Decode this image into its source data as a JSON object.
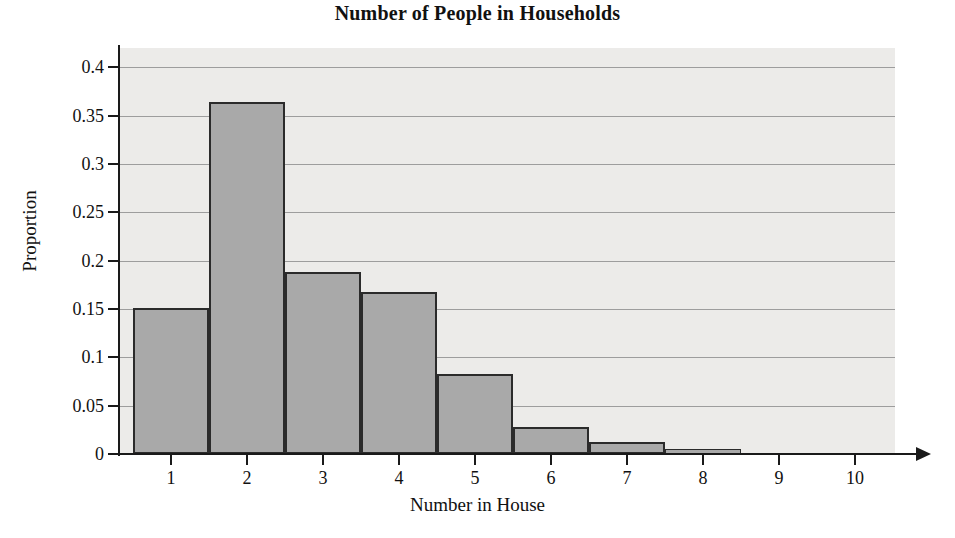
{
  "chart_data": {
    "type": "bar",
    "title": "Number of People in Households",
    "xlabel": "Number in House",
    "ylabel": "Proportion",
    "categories": [
      "1",
      "2",
      "3",
      "4",
      "5",
      "6",
      "7",
      "8",
      "9",
      "10"
    ],
    "values": [
      0.151,
      0.364,
      0.188,
      0.168,
      0.083,
      0.028,
      0.012,
      0.005,
      0.001,
      0.001
    ],
    "xlim": [
      0.5,
      10.5
    ],
    "ylim": [
      0,
      0.42
    ],
    "ytick_labels": [
      "0",
      "0.05",
      "0.1",
      "0.15",
      "0.2",
      "0.25",
      "0.3",
      "0.35",
      "0.4"
    ],
    "ytick_values": [
      0,
      0.05,
      0.1,
      0.15,
      0.2,
      0.25,
      0.3,
      0.35,
      0.4
    ],
    "xtick_labels": [
      "1",
      "2",
      "3",
      "4",
      "5",
      "6",
      "7",
      "8",
      "9",
      "10"
    ],
    "grid": true,
    "legend": false,
    "legend_position": "none",
    "colors": {
      "bar_fill": "#a9a9a9",
      "bar_edge": "#2b2b2b",
      "plot_background": "#ecebe9",
      "gridline": "#9d9d9d",
      "axis": "#1a1a1a",
      "text": "#111111"
    }
  }
}
